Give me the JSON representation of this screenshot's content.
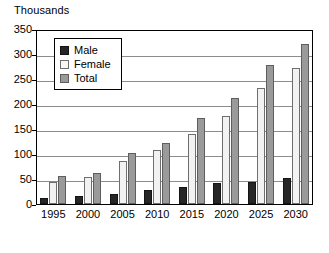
{
  "chart_data": {
    "type": "bar",
    "title": "",
    "ylabel": "Thousands",
    "xlabel": "",
    "ylim": [
      0,
      350
    ],
    "ytick_step": 50,
    "yticks": [
      350,
      300,
      250,
      200,
      150,
      100,
      50,
      0
    ],
    "grid": true,
    "legend_position": "top-left-inside",
    "categories": [
      "1995",
      "2000",
      "2005",
      "2010",
      "2015",
      "2020",
      "2025",
      "2030"
    ],
    "series": [
      {
        "name": "Male",
        "color": "#262626",
        "values": [
          12,
          17,
          21,
          28,
          34,
          43,
          45,
          52
        ]
      },
      {
        "name": "Female",
        "color": "#f2f2f2",
        "values": [
          45,
          54,
          86,
          108,
          140,
          177,
          232,
          272
        ]
      },
      {
        "name": "Total",
        "color": "#9a9a9a",
        "values": [
          57,
          62,
          103,
          122,
          172,
          212,
          278,
          320
        ]
      }
    ]
  },
  "legend": {
    "items": [
      {
        "label": "Male"
      },
      {
        "label": "Female"
      },
      {
        "label": "Total"
      }
    ]
  },
  "colors": {
    "male": "#262626",
    "female": "#f2f2f2",
    "total": "#9a9a9a",
    "gridline": "#8c8c8c",
    "frame": "#000000",
    "background": "#ffffff"
  }
}
